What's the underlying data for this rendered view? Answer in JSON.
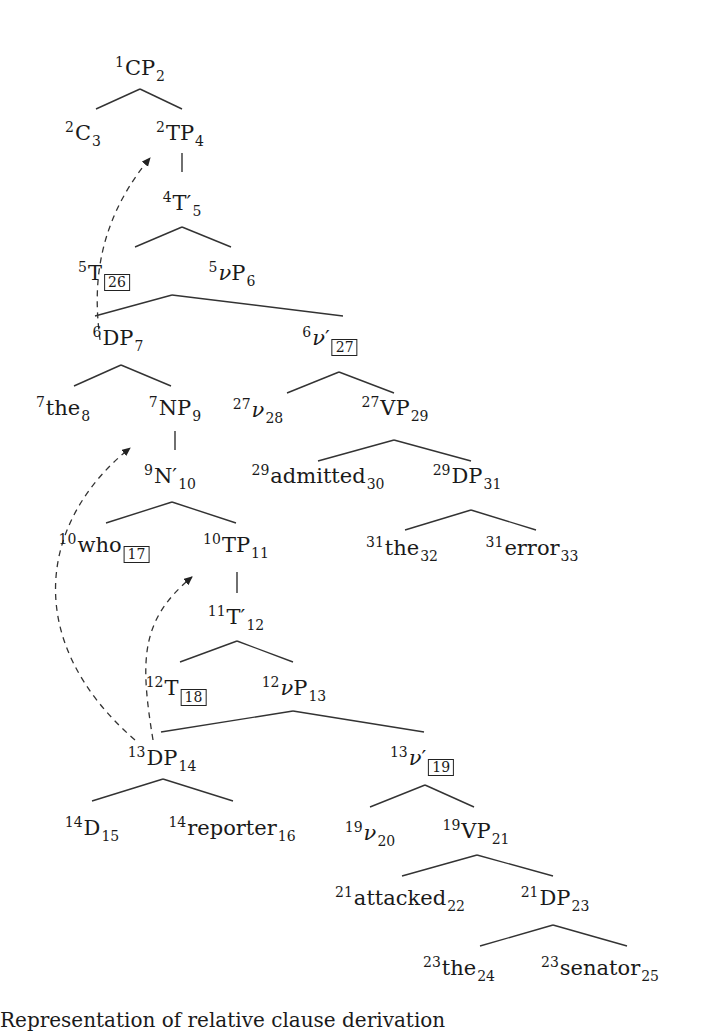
{
  "figure": {
    "type": "syntax-tree",
    "caption_fragment": "Representation of relative clause derivation",
    "nodes": [
      {
        "id": "n1",
        "pre": "1",
        "label": "CP",
        "sub": "2",
        "box": null,
        "italic": false,
        "x": 140,
        "y": 55
      },
      {
        "id": "n2",
        "pre": "2",
        "label": "C",
        "sub": "3",
        "box": null,
        "italic": false,
        "x": 83,
        "y": 120
      },
      {
        "id": "n3",
        "pre": "2",
        "label": "TP",
        "sub": "4",
        "box": null,
        "italic": false,
        "x": 180,
        "y": 120
      },
      {
        "id": "n4",
        "pre": "4",
        "label": "T′",
        "sub": "5",
        "box": null,
        "italic": false,
        "x": 182,
        "y": 190
      },
      {
        "id": "n5",
        "pre": "5",
        "label": "T",
        "sub": "",
        "box": "26",
        "italic": false,
        "x": 104,
        "y": 260
      },
      {
        "id": "n6",
        "pre": "5",
        "label": "νP",
        "sub": "6",
        "box": null,
        "italic": false,
        "x": 232,
        "y": 260
      },
      {
        "id": "n7",
        "pre": "6",
        "label": "DP",
        "sub": "7",
        "box": null,
        "italic": false,
        "x": 118,
        "y": 325
      },
      {
        "id": "n8",
        "pre": "6",
        "label": "ν′",
        "sub": "",
        "box": "27",
        "italic": false,
        "x": 330,
        "y": 325
      },
      {
        "id": "n9",
        "pre": "7",
        "label": "the",
        "sub": "8",
        "box": null,
        "italic": false,
        "x": 63,
        "y": 395
      },
      {
        "id": "n10",
        "pre": "7",
        "label": "NP",
        "sub": "9",
        "box": null,
        "italic": false,
        "x": 175,
        "y": 395
      },
      {
        "id": "n11",
        "pre": "27",
        "label": "ν",
        "sub": "28",
        "box": null,
        "italic": true,
        "x": 258,
        "y": 397
      },
      {
        "id": "n12",
        "pre": "27",
        "label": "VP",
        "sub": "29",
        "box": null,
        "italic": false,
        "x": 395,
        "y": 395
      },
      {
        "id": "n13",
        "pre": "9",
        "label": "N′",
        "sub": "10",
        "box": null,
        "italic": false,
        "x": 170,
        "y": 463
      },
      {
        "id": "n14",
        "pre": "29",
        "label": "admitted",
        "sub": "30",
        "box": null,
        "italic": false,
        "x": 318,
        "y": 463
      },
      {
        "id": "n15",
        "pre": "29",
        "label": "DP",
        "sub": "31",
        "box": null,
        "italic": false,
        "x": 467,
        "y": 463
      },
      {
        "id": "n16",
        "pre": "10",
        "label": "who",
        "sub": "",
        "box": "17",
        "italic": false,
        "x": 104,
        "y": 532
      },
      {
        "id": "n17",
        "pre": "10",
        "label": "TP",
        "sub": "11",
        "box": null,
        "italic": false,
        "x": 236,
        "y": 532
      },
      {
        "id": "n18",
        "pre": "31",
        "label": "the",
        "sub": "32",
        "box": null,
        "italic": false,
        "x": 402,
        "y": 535
      },
      {
        "id": "n19",
        "pre": "31",
        "label": "error",
        "sub": "33",
        "box": null,
        "italic": false,
        "x": 532,
        "y": 535
      },
      {
        "id": "n20",
        "pre": "11",
        "label": "T′",
        "sub": "12",
        "box": null,
        "italic": false,
        "x": 236,
        "y": 604
      },
      {
        "id": "n21",
        "pre": "12",
        "label": "T",
        "sub": "",
        "box": "18",
        "italic": false,
        "x": 176,
        "y": 675
      },
      {
        "id": "n22",
        "pre": "12",
        "label": "νP",
        "sub": "13",
        "box": null,
        "italic": false,
        "x": 294,
        "y": 675
      },
      {
        "id": "n23",
        "pre": "13",
        "label": "DP",
        "sub": "14",
        "box": null,
        "italic": false,
        "x": 162,
        "y": 745
      },
      {
        "id": "n24",
        "pre": "13",
        "label": "ν′",
        "sub": "",
        "box": "19",
        "italic": false,
        "x": 422,
        "y": 745
      },
      {
        "id": "n25",
        "pre": "14",
        "label": "D",
        "sub": "15",
        "box": null,
        "italic": false,
        "x": 92,
        "y": 815
      },
      {
        "id": "n26",
        "pre": "14",
        "label": "reporter",
        "sub": "16",
        "box": null,
        "italic": false,
        "x": 232,
        "y": 815
      },
      {
        "id": "n27",
        "pre": "19",
        "label": "ν",
        "sub": "20",
        "box": null,
        "italic": true,
        "x": 370,
        "y": 820
      },
      {
        "id": "n28",
        "pre": "19",
        "label": "VP",
        "sub": "21",
        "box": null,
        "italic": false,
        "x": 476,
        "y": 818
      },
      {
        "id": "n29",
        "pre": "21",
        "label": "attacked",
        "sub": "22",
        "box": null,
        "italic": false,
        "x": 400,
        "y": 885
      },
      {
        "id": "n30",
        "pre": "21",
        "label": "DP",
        "sub": "23",
        "box": null,
        "italic": false,
        "x": 555,
        "y": 885
      },
      {
        "id": "n31",
        "pre": "23",
        "label": "the",
        "sub": "24",
        "box": null,
        "italic": false,
        "x": 459,
        "y": 955
      },
      {
        "id": "n32",
        "pre": "23",
        "label": "senator",
        "sub": "25",
        "box": null,
        "italic": false,
        "x": 600,
        "y": 955
      }
    ],
    "edges": [
      {
        "from": "CP",
        "apex": [
          140,
          89
        ],
        "left": [
          96,
          109
        ],
        "right": [
          182,
          109
        ]
      },
      {
        "from": "TP4",
        "line": [
          [
            182,
            153
          ],
          [
            182,
            172
          ]
        ]
      },
      {
        "from": "T'5",
        "apex": [
          182,
          227
        ],
        "left": [
          135,
          247
        ],
        "right": [
          231,
          247
        ]
      },
      {
        "from": "vP6",
        "apex": [
          172,
          295
        ],
        "left": [
          95,
          316
        ],
        "right": [
          343,
          316
        ]
      },
      {
        "from": "DP7",
        "apex": [
          121,
          365
        ],
        "left": [
          74,
          386
        ],
        "right": [
          171,
          386
        ]
      },
      {
        "from": "v'27",
        "apex": [
          339,
          372
        ],
        "left": [
          287,
          393
        ],
        "right": [
          394,
          393
        ]
      },
      {
        "from": "NP9",
        "line": [
          [
            175,
            431
          ],
          [
            175,
            450
          ]
        ]
      },
      {
        "from": "VP29",
        "apex": [
          394,
          440
        ],
        "left": [
          318,
          461
        ],
        "right": [
          471,
          461
        ]
      },
      {
        "from": "N'10",
        "apex": [
          172,
          502
        ],
        "left": [
          106,
          523
        ],
        "right": [
          236,
          523
        ]
      },
      {
        "from": "DP31",
        "apex": [
          471,
          510
        ],
        "left": [
          405,
          530
        ],
        "right": [
          536,
          530
        ]
      },
      {
        "from": "TP11",
        "line": [
          [
            237,
            572
          ],
          [
            237,
            593
          ]
        ]
      },
      {
        "from": "T'12",
        "apex": [
          237,
          641
        ],
        "left": [
          180,
          662
        ],
        "right": [
          293,
          662
        ]
      },
      {
        "from": "vP13",
        "apex": [
          293,
          711
        ],
        "left": [
          161,
          732
        ],
        "right": [
          424,
          732
        ]
      },
      {
        "from": "DP14",
        "apex": [
          163,
          779
        ],
        "left": [
          92,
          801
        ],
        "right": [
          233,
          801
        ]
      },
      {
        "from": "v'19",
        "apex": [
          425,
          785
        ],
        "left": [
          370,
          807
        ],
        "right": [
          474,
          807
        ]
      },
      {
        "from": "VP21",
        "apex": [
          477,
          855
        ],
        "left": [
          402,
          876
        ],
        "right": [
          553,
          876
        ]
      },
      {
        "from": "DP23",
        "apex": [
          553,
          925
        ],
        "left": [
          480,
          946
        ],
        "right": [
          627,
          946
        ]
      }
    ],
    "movement_arrows": [
      {
        "label": "DP7 to spec-TP4",
        "path": "M 100 340 C 95 300, 90 230, 150 158",
        "head": [
          150,
          158
        ]
      },
      {
        "label": "DP14 to NP9 (who)",
        "path": "M 135 740 C 20 640, 40 520, 130 448",
        "head": [
          130,
          448
        ]
      },
      {
        "label": "DP14 to TP11",
        "path": "M 153 740 C 140 660, 140 620, 192 577",
        "head": [
          192,
          577
        ]
      }
    ]
  }
}
